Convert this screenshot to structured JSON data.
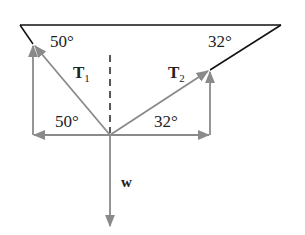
{
  "diagram": {
    "type": "force-diagram",
    "labels": {
      "angle_top_left": "50°",
      "angle_top_right": "32°",
      "angle_bottom_left": "50°",
      "angle_bottom_right": "32°",
      "t1_main": "T",
      "t1_sub": "1",
      "t2_main": "T",
      "t2_sub": "2",
      "weight": "w"
    },
    "colors": {
      "support_line": "#111111",
      "vector": "#8a8a8a",
      "dashed": "#222222"
    },
    "vectors": [
      {
        "name": "T1",
        "from": [
          110,
          135
        ],
        "to": [
          33,
          44
        ]
      },
      {
        "name": "T2",
        "from": [
          110,
          135
        ],
        "to": [
          210,
          70
        ]
      },
      {
        "name": "w",
        "from": [
          110,
          135
        ],
        "to": [
          110,
          228
        ]
      },
      {
        "name": "T1x",
        "from": [
          110,
          135
        ],
        "to": [
          33,
          135
        ]
      },
      {
        "name": "T1y",
        "from": [
          33,
          135
        ],
        "to": [
          33,
          44
        ]
      },
      {
        "name": "T2x",
        "from": [
          110,
          135
        ],
        "to": [
          210,
          135
        ]
      },
      {
        "name": "T2y",
        "from": [
          210,
          135
        ],
        "to": [
          210,
          70
        ]
      }
    ]
  }
}
